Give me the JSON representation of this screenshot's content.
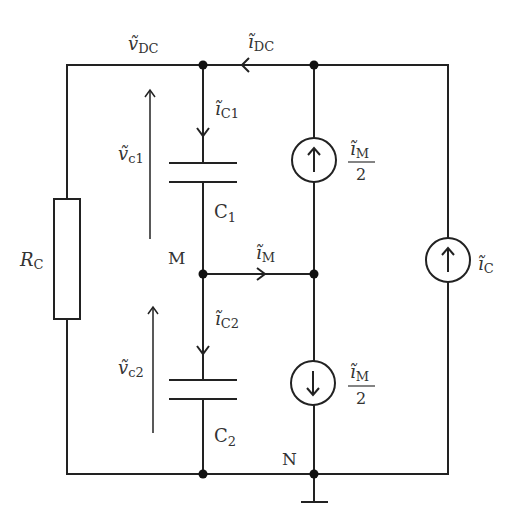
{
  "diagram": {
    "type": "circuit-schematic",
    "labels": {
      "v_dc": {
        "sym": "ṽ",
        "sub": "DC"
      },
      "i_dc": {
        "sym": "ĩ",
        "sub": "DC"
      },
      "i_c1": {
        "sym": "ĩ",
        "sub": "C1"
      },
      "v_c1": {
        "sym": "ṽ",
        "sub": "c1"
      },
      "c1": {
        "sym": "C",
        "sub": "1"
      },
      "m_node": "M",
      "i_m": {
        "sym": "ĩ",
        "sub": "M"
      },
      "i_c2": {
        "sym": "ĩ",
        "sub": "C2"
      },
      "v_c2": {
        "sym": "ṽ",
        "sub": "c2"
      },
      "c2": {
        "sym": "C",
        "sub": "2"
      },
      "n_node": "N",
      "rc": {
        "sym": "R",
        "sub": "C"
      },
      "i_c": {
        "sym": "ĩ",
        "sub": "C"
      },
      "src_top": {
        "num_sym": "ĩ",
        "num_sub": "M",
        "den": "2"
      },
      "src_bottom": {
        "num_sym": "ĩ",
        "num_sub": "M",
        "den": "2"
      }
    },
    "components": [
      {
        "id": "RC",
        "kind": "resistor"
      },
      {
        "id": "C1",
        "kind": "capacitor"
      },
      {
        "id": "C2",
        "kind": "capacitor"
      },
      {
        "id": "src_top",
        "kind": "current-source",
        "direction": "up",
        "value": "i_M/2"
      },
      {
        "id": "src_bottom",
        "kind": "current-source",
        "direction": "down",
        "value": "i_M/2"
      },
      {
        "id": "src_ic",
        "kind": "current-source",
        "direction": "up",
        "value": "i_C"
      },
      {
        "id": "ground",
        "kind": "ground"
      }
    ],
    "colors": {
      "line": "#222222",
      "text": "#333333",
      "background": "#ffffff"
    }
  }
}
